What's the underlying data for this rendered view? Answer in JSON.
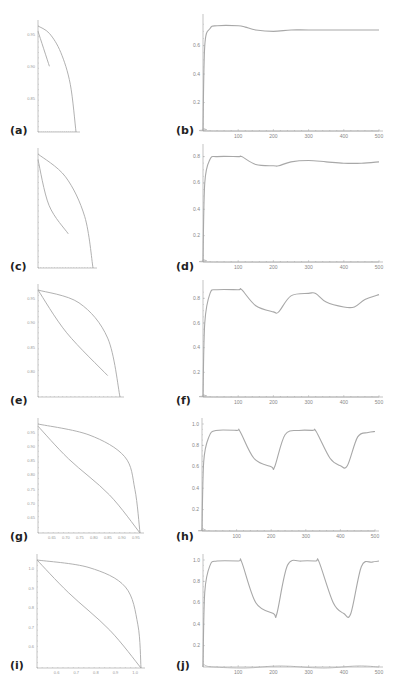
{
  "chart_data": [
    {
      "id": "a",
      "label": "(a)",
      "type": "line",
      "x_ticks": [
        "",
        "",
        "",
        "",
        "",
        ""
      ],
      "y_ticks": [
        "0.95",
        "0.90",
        "0.85"
      ],
      "series": [
        {
          "name": "outer",
          "points": [
            [
              0,
              1.0
            ],
            [
              0.3,
              0.93
            ],
            [
              0.6,
              0.75
            ],
            [
              0.85,
              0.45
            ],
            [
              1,
              0
            ]
          ]
        },
        {
          "name": "inner",
          "points": [
            [
              0,
              0.95
            ],
            [
              0.3,
              0.62
            ]
          ]
        }
      ]
    },
    {
      "id": "b",
      "label": "(b)",
      "type": "line",
      "xlabel": "",
      "ylabel": "",
      "x_ticks": [
        "100",
        "200",
        "300",
        "400",
        "500"
      ],
      "y_ticks": [
        "0.2",
        "0.4",
        "0.6"
      ],
      "xlim": [
        0,
        500
      ],
      "ylim": [
        0,
        0.78
      ],
      "series": [
        {
          "name": "main",
          "x": [
            0,
            5,
            20,
            40,
            100,
            120,
            150,
            200,
            250,
            300,
            400,
            500
          ],
          "values": [
            0.0,
            0.6,
            0.72,
            0.74,
            0.74,
            0.73,
            0.71,
            0.7,
            0.71,
            0.71,
            0.71,
            0.71
          ]
        },
        {
          "name": "small",
          "x": [
            0,
            10,
            30,
            500
          ],
          "values": [
            0.02,
            0.01,
            0.0,
            0.0
          ]
        }
      ]
    },
    {
      "id": "c",
      "label": "(c)",
      "type": "line",
      "y_ticks": [
        "",
        "",
        "",
        "",
        ""
      ],
      "series": [
        {
          "name": "outer",
          "points": [
            [
              0,
              1.0
            ],
            [
              0.5,
              0.8
            ],
            [
              0.85,
              0.45
            ],
            [
              1,
              0
            ]
          ]
        },
        {
          "name": "inner",
          "points": [
            [
              0,
              0.95
            ],
            [
              0.2,
              0.55
            ],
            [
              0.55,
              0.3
            ]
          ]
        }
      ]
    },
    {
      "id": "d",
      "label": "(d)",
      "type": "line",
      "x_ticks": [
        "100",
        "200",
        "300",
        "400",
        "500"
      ],
      "y_ticks": [
        "0.2",
        "0.4",
        "0.6",
        "0.8"
      ],
      "xlim": [
        0,
        500
      ],
      "ylim": [
        0,
        0.85
      ],
      "series": [
        {
          "name": "main",
          "x": [
            0,
            5,
            20,
            40,
            100,
            110,
            150,
            200,
            215,
            250,
            300,
            350,
            400,
            450,
            500
          ],
          "values": [
            0,
            0.6,
            0.78,
            0.8,
            0.8,
            0.8,
            0.74,
            0.73,
            0.73,
            0.76,
            0.77,
            0.76,
            0.75,
            0.75,
            0.76
          ]
        },
        {
          "name": "small",
          "x": [
            0,
            10,
            30,
            500
          ],
          "values": [
            0.02,
            0.01,
            0.0,
            0.0
          ]
        }
      ]
    },
    {
      "id": "e",
      "label": "(e)",
      "type": "line",
      "y_ticks": [
        "0.95",
        "0.90",
        "0.85",
        "0.80"
      ],
      "x_ticks": [
        "",
        "",
        "",
        "",
        "",
        ""
      ],
      "series": [
        {
          "name": "outer",
          "points": [
            [
              0,
              1.0
            ],
            [
              0.5,
              0.88
            ],
            [
              0.85,
              0.55
            ],
            [
              1,
              0
            ]
          ]
        },
        {
          "name": "inner",
          "points": [
            [
              0,
              1.0
            ],
            [
              0.35,
              0.6
            ],
            [
              0.85,
              0.2
            ]
          ]
        }
      ]
    },
    {
      "id": "f",
      "label": "(f)",
      "type": "line",
      "x_ticks": [
        "100",
        "200",
        "300",
        "400",
        "500"
      ],
      "y_ticks": [
        "0.2",
        "0.4",
        "0.6",
        "0.8"
      ],
      "xlim": [
        0,
        500
      ],
      "ylim": [
        0,
        0.9
      ],
      "series": [
        {
          "name": "main",
          "x": [
            0,
            5,
            20,
            40,
            100,
            110,
            150,
            200,
            215,
            250,
            300,
            320,
            350,
            400,
            430,
            460,
            500
          ],
          "values": [
            0,
            0.6,
            0.84,
            0.87,
            0.87,
            0.87,
            0.74,
            0.69,
            0.69,
            0.82,
            0.84,
            0.84,
            0.77,
            0.73,
            0.73,
            0.79,
            0.83
          ]
        },
        {
          "name": "small",
          "x": [
            0,
            10,
            30,
            500
          ],
          "values": [
            0.02,
            0.01,
            0.0,
            0.0
          ]
        }
      ]
    },
    {
      "id": "g",
      "label": "(g)",
      "type": "line",
      "y_ticks": [
        "0.95",
        "0.90",
        "0.85",
        "0.80",
        "0.75",
        "0.70",
        "0.65"
      ],
      "x_ticks": [
        "0.65",
        "0.70",
        "0.75",
        "0.80",
        "0.85",
        "0.90",
        "0.95"
      ],
      "series": [
        {
          "name": "outer",
          "points": [
            [
              0,
              1.0
            ],
            [
              0.5,
              0.9
            ],
            [
              0.85,
              0.7
            ],
            [
              0.95,
              0.4
            ],
            [
              1,
              0
            ]
          ]
        },
        {
          "name": "inner",
          "points": [
            [
              0,
              0.98
            ],
            [
              0.3,
              0.68
            ],
            [
              0.7,
              0.35
            ],
            [
              1,
              0
            ]
          ]
        }
      ]
    },
    {
      "id": "h",
      "label": "(h)",
      "type": "line",
      "x_ticks": [
        "100",
        "200",
        "300",
        "400",
        "500"
      ],
      "y_ticks": [
        "0.2",
        "0.4",
        "0.6",
        "0.8",
        "1.0"
      ],
      "xlim": [
        0,
        500
      ],
      "ylim": [
        0,
        1.0
      ],
      "series": [
        {
          "name": "main",
          "x": [
            0,
            5,
            20,
            40,
            100,
            110,
            150,
            200,
            210,
            240,
            280,
            320,
            330,
            370,
            400,
            420,
            450,
            480,
            500
          ],
          "values": [
            0,
            0.65,
            0.88,
            0.94,
            0.94,
            0.93,
            0.68,
            0.6,
            0.6,
            0.9,
            0.94,
            0.94,
            0.93,
            0.68,
            0.61,
            0.61,
            0.88,
            0.92,
            0.93
          ]
        },
        {
          "name": "small",
          "x": [
            0,
            10,
            30,
            500
          ],
          "values": [
            0.03,
            0.01,
            0.0,
            0.0
          ]
        }
      ]
    },
    {
      "id": "i",
      "label": "(i)",
      "type": "line",
      "y_ticks": [
        "1.0",
        "0.9",
        "0.8",
        "0.7",
        "0.6"
      ],
      "x_ticks": [
        "0.6",
        "0.7",
        "0.8",
        "0.9",
        "1.0"
      ],
      "series": [
        {
          "name": "outer",
          "points": [
            [
              0,
              1.0
            ],
            [
              0.5,
              0.93
            ],
            [
              0.85,
              0.75
            ],
            [
              0.97,
              0.4
            ],
            [
              1,
              0
            ]
          ]
        },
        {
          "name": "inner",
          "points": [
            [
              0,
              1.0
            ],
            [
              0.3,
              0.7
            ],
            [
              0.7,
              0.35
            ],
            [
              1,
              0
            ]
          ]
        }
      ]
    },
    {
      "id": "j",
      "label": "(j)",
      "type": "line",
      "x_ticks": [
        "100",
        "200",
        "300",
        "400",
        "500"
      ],
      "y_ticks": [
        "0.2",
        "0.4",
        "0.6",
        "0.8",
        "1.0"
      ],
      "xlim": [
        0,
        500
      ],
      "ylim": [
        0,
        1.0
      ],
      "series": [
        {
          "name": "main",
          "x": [
            0,
            5,
            20,
            40,
            100,
            110,
            150,
            200,
            210,
            240,
            280,
            320,
            330,
            370,
            400,
            420,
            450,
            480,
            500
          ],
          "values": [
            0,
            0.7,
            0.95,
            0.99,
            0.99,
            0.98,
            0.6,
            0.5,
            0.5,
            0.95,
            0.99,
            0.99,
            0.98,
            0.6,
            0.5,
            0.5,
            0.94,
            0.98,
            0.99
          ]
        },
        {
          "name": "small",
          "x": [
            0,
            10,
            30,
            120,
            220,
            340,
            440,
            500
          ],
          "values": [
            0.03,
            0.01,
            0.0,
            -0.01,
            0.01,
            -0.01,
            0.01,
            0.0
          ]
        }
      ]
    }
  ],
  "labels": {
    "a": "(a)",
    "b": "(b)",
    "c": "(c)",
    "d": "(d)",
    "e": "(e)",
    "f": "(f)",
    "g": "(g)",
    "h": "(h)",
    "i": "(i)",
    "j": "(j)"
  },
  "colors": {
    "curve": "#a8a8a8",
    "axis": "#9a9a9a",
    "label": "#222222"
  }
}
